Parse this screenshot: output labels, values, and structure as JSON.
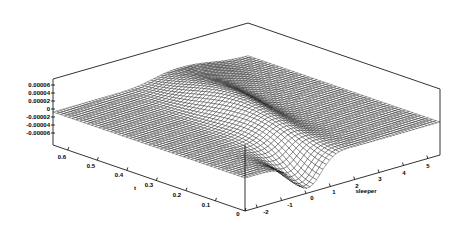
{
  "chart_data": {
    "type": "surface3d",
    "title": "",
    "xlabel": "sleeper",
    "ylabel": "t",
    "zlabel": "",
    "x_ticks": [
      "-2",
      "-1",
      "0",
      "1",
      "2",
      "3",
      "4",
      "5"
    ],
    "y_ticks": [
      "0",
      "0.1",
      "0.2",
      "0.3",
      "0.4",
      "0.5",
      "0.6"
    ],
    "z_ticks": [
      "0.00006",
      "0.00004",
      "0.00002",
      "0",
      "-0.00002",
      "-0.00004",
      "-0.00006"
    ],
    "xlim": [
      -2.5,
      5.5
    ],
    "ylim": [
      0,
      0.65
    ],
    "zlim": [
      -7e-05,
      7e-05
    ],
    "grid": false,
    "legend": null,
    "surface_description": "Wireframe mesh; flat at z=0 for large t; near t=0 a traveling wave: positive ridge near sleeper≈0–1 (z≈+0.00004), deep trough near sleeper≈0 at small t (z≈-0.00006), curving ridge along t≈0.3–0.5",
    "mesh_resolution": {
      "nx": 60,
      "ny": 50
    }
  },
  "axes": {
    "z_tick_labels": [
      "0.00006",
      "0.00004",
      "0.00002",
      "0",
      "-0.00002",
      "-0.00004",
      "-0.00006"
    ],
    "t_tick_labels": [
      "0.6",
      "0.5",
      "0.4",
      "0.3",
      "0.2",
      "0.1",
      "0"
    ],
    "t_axis_title": "t",
    "sleeper_tick_labels": [
      "-2",
      "-1",
      "0",
      "1",
      "2",
      "3",
      "4",
      "5"
    ],
    "sleeper_axis_title": "sleeper"
  }
}
